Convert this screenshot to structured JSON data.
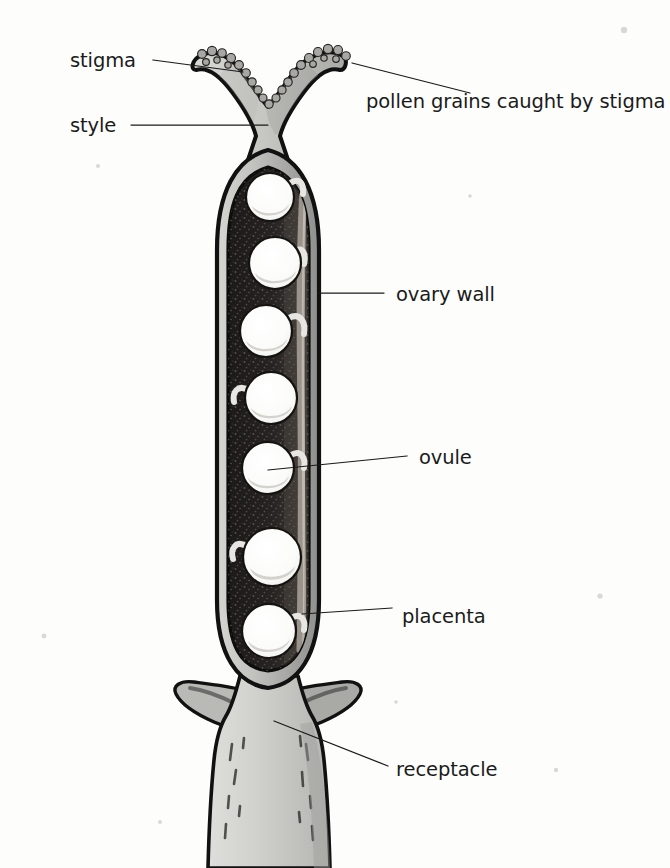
{
  "figure": {
    "background_color": "#fdfdfc",
    "ink_color": "#1a1a1a"
  },
  "colors": {
    "outline": "#121212",
    "wall_light": "#c9c9c9",
    "wall_mid": "#a8a8a8",
    "locule_dark": "#211f1e",
    "locule_stipple": "#3a3734",
    "ovule_white": "#fdfdfd",
    "ovule_shade": "#cfcfcb",
    "style_fill": "#c6c6c4",
    "receptacle_fill": "#d2d2ce",
    "pollen_fill": "#b4b2ae",
    "leader_line": "#1a1a1a",
    "text": "#1b1b1b"
  },
  "labels": [
    {
      "id": "stigma",
      "text": "stigma",
      "text_x": 70,
      "text_y": 67,
      "anchor": "start",
      "leader": "M 153 60 L 243 72",
      "side": "left"
    },
    {
      "id": "style",
      "text": "style",
      "text_x": 70,
      "text_y": 132,
      "anchor": "start",
      "leader": "M 131 125 L 268 125",
      "side": "left"
    },
    {
      "id": "pollen-grains",
      "text": "pollen grains caught by stigma",
      "text_x": 366,
      "text_y": 108,
      "anchor": "start",
      "leader": "M 352 63 L 470 93",
      "side": "right"
    },
    {
      "id": "ovary-wall",
      "text": "ovary wall",
      "text_x": 396,
      "text_y": 301,
      "anchor": "start",
      "leader": "M 318 293 L 384 293",
      "side": "right"
    },
    {
      "id": "ovule",
      "text": "ovule",
      "text_x": 419,
      "text_y": 464,
      "anchor": "start",
      "leader": "M 268 470 L 407 456",
      "side": "right"
    },
    {
      "id": "placenta",
      "text": "placenta",
      "text_x": 402,
      "text_y": 623,
      "anchor": "start",
      "leader": "M 302 614 L 392 608",
      "side": "right"
    },
    {
      "id": "receptacle",
      "text": "receptacle",
      "text_x": 396,
      "text_y": 776,
      "anchor": "start",
      "leader": "M 274 721 L 388 766",
      "side": "right"
    }
  ],
  "structure": {
    "stigma": {
      "name": "stigma",
      "description": "bilobed Y-shaped receptive tip",
      "top_y": 44,
      "left_lobe_x": 198,
      "right_lobe_x": 345
    },
    "style": {
      "name": "style",
      "description": "narrow stalk connecting stigma to ovary",
      "neck_left_x": 243,
      "neck_right_x": 290,
      "neck_y": 128
    },
    "ovary": {
      "name": "ovary",
      "outer_left_x": 211,
      "outer_right_x": 319,
      "top_y": 150,
      "bottom_y": 685,
      "wall_thickness": 17
    },
    "locule": {
      "name": "locule",
      "inner_left_x": 228,
      "inner_right_x": 308,
      "top_y": 166,
      "bottom_y": 672
    },
    "receptacle": {
      "name": "receptacle",
      "description": "swollen base bearing lateral flanges, tapering to a stalk",
      "top_y": 675,
      "stalk_bottom_y": 868,
      "flange_left_x": 176,
      "flange_right_x": 358
    }
  },
  "ovules": {
    "count": 7,
    "radius": 24,
    "items": [
      {
        "index": 1,
        "cx": 270,
        "cy": 197,
        "r": 24,
        "attach": "right"
      },
      {
        "index": 2,
        "cx": 275,
        "cy": 263,
        "r": 26,
        "attach": "right"
      },
      {
        "index": 3,
        "cx": 266,
        "cy": 331,
        "r": 26,
        "attach": "right"
      },
      {
        "index": 4,
        "cx": 271,
        "cy": 398,
        "r": 26,
        "attach": "left"
      },
      {
        "index": 5,
        "cx": 268,
        "cy": 468,
        "r": 26,
        "attach": "right"
      },
      {
        "index": 6,
        "cx": 272,
        "cy": 557,
        "r": 29,
        "attach": "left"
      },
      {
        "index": 7,
        "cx": 269,
        "cy": 631,
        "r": 27,
        "attach": "right"
      }
    ]
  },
  "pollen_grains": {
    "count": 26,
    "description": "small rounded grains adhering to the upper stigma surface"
  }
}
